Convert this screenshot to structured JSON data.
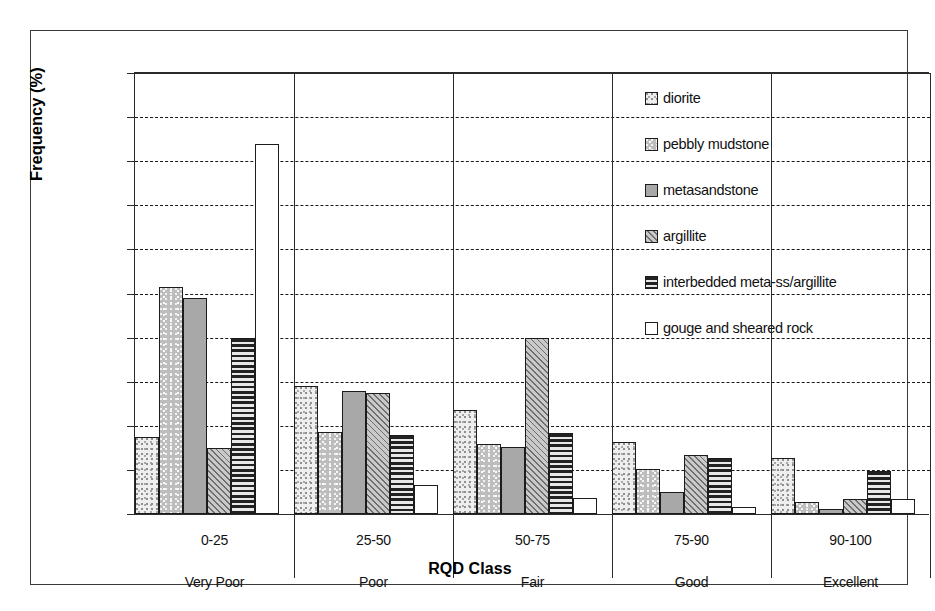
{
  "chart_data": {
    "type": "bar",
    "title": "",
    "xlabel": "RQD Class",
    "ylabel": "Frequency (%)",
    "ylim": [
      0,
      100
    ],
    "ytick_values": [
      0,
      10,
      20,
      30,
      40,
      50,
      60,
      70,
      80,
      90,
      100
    ],
    "ytick_labels": [
      "0",
      "10",
      "20",
      "30",
      "40",
      "50",
      "60",
      "70",
      "80",
      "90",
      "100"
    ],
    "grid": true,
    "legend_position": "inside-upper-right",
    "categories": [
      "0-25",
      "25-50",
      "50-75",
      "75-90",
      "90-100"
    ],
    "category_sublabels": [
      "Very Poor",
      "Poor",
      "Fair",
      "Good",
      "Excellent"
    ],
    "series": [
      {
        "name": "diorite",
        "pattern": "fine-light-speckle",
        "values": [
          17.5,
          29.0,
          23.5,
          16.3,
          12.7
        ]
      },
      {
        "name": "pebbly mudstone",
        "pattern": "medium-speckle",
        "values": [
          51.5,
          18.5,
          15.8,
          10.2,
          2.8
        ]
      },
      {
        "name": "metasandstone",
        "pattern": "solid-gray",
        "values": [
          49.0,
          28.0,
          15.2,
          5.0,
          1.2
        ]
      },
      {
        "name": "argillite",
        "pattern": "diagonal-hatch",
        "values": [
          15.0,
          27.5,
          39.8,
          13.3,
          3.5
        ]
      },
      {
        "name": "interbedded meta-ss/argillite",
        "pattern": "horizontal-lines",
        "values": [
          40.0,
          18.0,
          18.3,
          12.8,
          9.8
        ]
      },
      {
        "name": "gouge and sheared rock",
        "pattern": "white",
        "values": [
          84.0,
          6.5,
          3.7,
          1.5,
          3.3
        ]
      }
    ]
  },
  "axes": {
    "y_title": "Frequency (%)",
    "x_title": "RQD Class",
    "y_ticks": [
      "100",
      "90",
      "80",
      "70",
      "60",
      "50",
      "40",
      "30",
      "20",
      "10",
      "0"
    ]
  },
  "categories": [
    {
      "range": "0-25",
      "quality": "Very Poor"
    },
    {
      "range": "25-50",
      "quality": "Poor"
    },
    {
      "range": "50-75",
      "quality": "Fair"
    },
    {
      "range": "75-90",
      "quality": "Good"
    },
    {
      "range": "90-100",
      "quality": "Excellent"
    }
  ],
  "legend": {
    "items": [
      {
        "label": "diorite"
      },
      {
        "label": "pebbly mudstone"
      },
      {
        "label": "metasandstone"
      },
      {
        "label": "argillite"
      },
      {
        "label": "interbedded meta-ss/argillite"
      },
      {
        "label": "gouge and sheared rock"
      }
    ]
  },
  "colors": {
    "axis": "#2b2b2b",
    "frame": "#3a3a3a",
    "grid": "#1a1a1a",
    "text": "#111111",
    "background": "#ffffff"
  }
}
